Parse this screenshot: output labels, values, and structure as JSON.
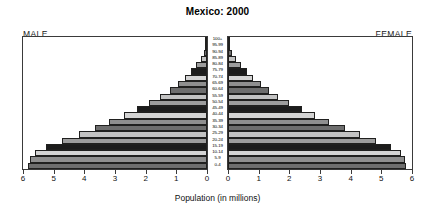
{
  "chart_data": {
    "type": "bar",
    "subtype": "population-pyramid",
    "title": "Mexico: 2000",
    "xlabel": "Population (in millions)",
    "ylabel": "",
    "xlim": [
      0,
      6
    ],
    "grid": false,
    "legend_position": "none",
    "left_panel_label": "MALE",
    "right_panel_label": "FEMALE",
    "categories": [
      "100+",
      "95-99",
      "90-94",
      "85-89",
      "80-84",
      "75-79",
      "70-74",
      "65-69",
      "60-64",
      "55-59",
      "50-54",
      "45-49",
      "40-44",
      "35-39",
      "30-34",
      "25-29",
      "20-24",
      "15-19",
      "10-14",
      "5-9",
      "0-4"
    ],
    "x_tick_labels_left": [
      "6",
      "5",
      "4",
      "3",
      "2",
      "1",
      "0"
    ],
    "x_tick_labels_right": [
      "0",
      "1",
      "2",
      "3",
      "4",
      "5",
      "6"
    ],
    "x_tick_values": [
      0,
      1,
      2,
      3,
      4,
      5,
      6
    ],
    "series": [
      {
        "name": "MALE",
        "side": "left",
        "values": [
          0.02,
          0.05,
          0.11,
          0.21,
          0.36,
          0.52,
          0.72,
          0.95,
          1.22,
          1.52,
          1.88,
          2.28,
          2.72,
          3.18,
          3.66,
          4.18,
          4.72,
          5.25,
          5.62,
          5.78,
          5.85
        ]
      },
      {
        "name": "FEMALE",
        "side": "right",
        "values": [
          0.03,
          0.07,
          0.14,
          0.26,
          0.43,
          0.61,
          0.82,
          1.06,
          1.34,
          1.64,
          2.0,
          2.4,
          2.84,
          3.3,
          3.8,
          4.32,
          4.84,
          5.32,
          5.64,
          5.76,
          5.8
        ]
      }
    ],
    "bar_colors_cycle": [
      "#d4d4d4",
      "#8f8f8f",
      "#6e6e6e",
      "#c3c3c3",
      "#9d9d9d",
      "#1c1c1c"
    ],
    "bar_colors": [
      "#d4d4d4",
      "#8f8f8f",
      "#6e6e6e",
      "#c3c3c3",
      "#9d9d9d",
      "#1c1c1c",
      "#d4d4d4",
      "#8f8f8f",
      "#6e6e6e",
      "#c3c3c3",
      "#9d9d9d",
      "#1c1c1c",
      "#d4d4d4",
      "#8f8f8f",
      "#6e6e6e",
      "#c3c3c3",
      "#9d9d9d",
      "#1c1c1c",
      "#d4d4d4",
      "#8f8f8f",
      "#6e6e6e"
    ],
    "frame_color": "#3a3a3a",
    "background_color": "#ffffff"
  }
}
